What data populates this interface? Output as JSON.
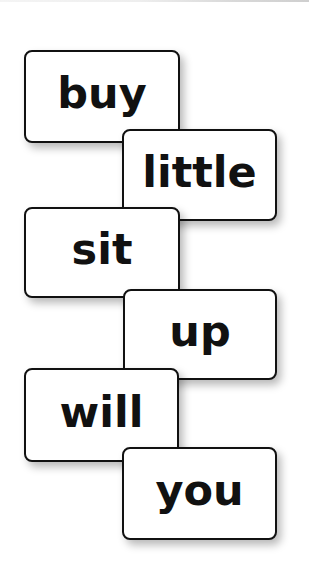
{
  "cards": [
    {
      "word": "buy"
    },
    {
      "word": "little"
    },
    {
      "word": "sit"
    },
    {
      "word": "up"
    },
    {
      "word": "will"
    },
    {
      "word": "you"
    }
  ],
  "colors": {
    "card_border": "#111111",
    "card_fill": "#ffffff",
    "text": "#111111",
    "background": "#ffffff"
  }
}
